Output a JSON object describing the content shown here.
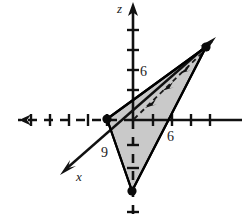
{
  "figure": {
    "kind": "3d-coordinate-plot",
    "canvas": {
      "width": 242,
      "height": 222,
      "background": "#ffffff"
    },
    "colors": {
      "axis": "#1a1a1a",
      "outline": "#000000",
      "shade_fill": "#c9c9c9",
      "label": "#222222"
    },
    "axes": [
      {
        "name": "z-axis",
        "label": "z",
        "label_pos": {
          "x": 122,
          "y": 12
        },
        "style": "solid",
        "from": {
          "x": 133,
          "y": 120
        },
        "to": {
          "x": 133,
          "y": 4
        },
        "arrow": true,
        "ticks": [
          {
            "y": 30
          },
          {
            "y": 50
          },
          {
            "y": 70
          },
          {
            "y": 90
          }
        ],
        "tick_labels": [
          {
            "text": "6",
            "x": 141,
            "y": 75
          }
        ]
      },
      {
        "name": "z-axis-negative",
        "label": "",
        "style": "dashed",
        "from": {
          "x": 133,
          "y": 120
        },
        "to": {
          "x": 133,
          "y": 220
        },
        "arrow": false,
        "ticks": [
          {
            "y": 145
          },
          {
            "y": 168
          },
          {
            "y": 212
          }
        ],
        "tick_labels": []
      },
      {
        "name": "y-axis-positive",
        "label": "",
        "style": "solid",
        "from": {
          "x": 133,
          "y": 120
        },
        "to": {
          "x": 242,
          "y": 120
        },
        "arrow": false,
        "ticks": [
          {
            "x": 153
          },
          {
            "x": 172
          },
          {
            "x": 191
          },
          {
            "x": 210
          }
        ],
        "tick_labels": [
          {
            "text": "6",
            "x": 172,
            "y": 139
          }
        ]
      },
      {
        "name": "y-axis-negative",
        "label": "",
        "style": "dashed",
        "from": {
          "x": 133,
          "y": 120
        },
        "to": {
          "x": 10,
          "y": 120
        },
        "arrow": true,
        "ticks": [
          {
            "x": 107
          },
          {
            "x": 88
          },
          {
            "x": 69
          },
          {
            "x": 50
          },
          {
            "x": 31
          }
        ],
        "tick_labels": []
      },
      {
        "name": "x-axis",
        "label": "x",
        "label_pos": {
          "x": 80,
          "y": 178
        },
        "style": "solid",
        "from": {
          "x": 210,
          "y": 43
        },
        "to": {
          "x": 61,
          "y": 173
        },
        "arrow": true,
        "ticks": [],
        "tick_labels": [
          {
            "text": "9",
            "x": 106,
            "y": 155
          }
        ]
      }
    ],
    "region": {
      "name": "shaded-triangle",
      "fill": "#c9c9c9",
      "stroke": "#000000",
      "vertices": [
        {
          "name": "x-intercept-vertex",
          "x": 107,
          "y": 119
        },
        {
          "name": "y-intercept-vertex",
          "x": 206,
          "y": 47
        },
        {
          "name": "z-intercept-vertex",
          "x": 132,
          "y": 191
        }
      ]
    },
    "vertex_dots": [
      {
        "name": "dot-x-intercept",
        "x": 107,
        "y": 119,
        "r": 4.5
      },
      {
        "name": "dot-y-intercept",
        "x": 206,
        "y": 47,
        "r": 4.5
      },
      {
        "name": "dot-z-intercept",
        "x": 132,
        "y": 191,
        "r": 4.5
      }
    ],
    "guide_line": {
      "name": "dashed-direction-line",
      "style": "dashed",
      "from": {
        "x": 133,
        "y": 120
      },
      "to": {
        "x": 203,
        "y": 52
      },
      "chevrons": [
        {
          "x": 151,
          "y": 103
        },
        {
          "x": 168,
          "y": 86
        },
        {
          "x": 185,
          "y": 69
        }
      ]
    },
    "tick_marks_text": {
      "z_six": "6",
      "y_six": "6",
      "x_nine": "9",
      "z_axis_name": "z",
      "x_axis_name": "x"
    }
  }
}
